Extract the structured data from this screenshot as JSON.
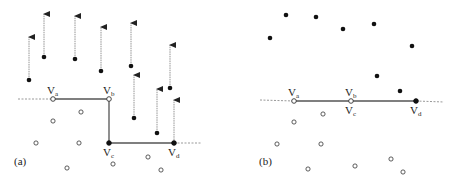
{
  "colors": {
    "point": "#111111",
    "solid_line": "#555555",
    "dashed_line": "#999999",
    "arrow": "#888888"
  },
  "panels": [
    {
      "id": "a",
      "label": "(a)",
      "label_pos": [
        14,
        165
      ],
      "dashed_left": [
        [
          18,
          99
        ],
        [
          53,
          99
        ]
      ],
      "dashed_right": [
        [
          174,
          143
        ],
        [
          202,
          143
        ]
      ],
      "path": [
        [
          53,
          99
        ],
        [
          109,
          99
        ],
        [
          109,
          143
        ],
        [
          174,
          143
        ]
      ],
      "vertices": [
        {
          "name": "Va",
          "main": "V",
          "sub": "a",
          "x": 53,
          "y": 99,
          "filled": false,
          "label_dx": -6,
          "label_dy": -5
        },
        {
          "name": "Vb",
          "main": "V",
          "sub": "b",
          "x": 109,
          "y": 99,
          "filled": false,
          "label_dx": -6,
          "label_dy": -5
        },
        {
          "name": "Vc",
          "main": "V",
          "sub": "c",
          "x": 109,
          "y": 143,
          "filled": true,
          "label_dx": -6,
          "label_dy": 13
        },
        {
          "name": "Vd",
          "main": "V",
          "sub": "d",
          "x": 174,
          "y": 143,
          "filled": true,
          "label_dx": -6,
          "label_dy": 13
        }
      ],
      "filled_points": [
        {
          "x": 29,
          "y": 80,
          "arrow_top": 37
        },
        {
          "x": 44,
          "y": 57,
          "arrow_top": 14
        },
        {
          "x": 75,
          "y": 59,
          "arrow_top": 16
        },
        {
          "x": 101,
          "y": 71,
          "arrow_top": 27
        },
        {
          "x": 131,
          "y": 66,
          "arrow_top": 23
        },
        {
          "x": 134,
          "y": 118,
          "arrow_top": 75
        },
        {
          "x": 157,
          "y": 133,
          "arrow_top": 89
        },
        {
          "x": 170,
          "y": 88,
          "arrow_top": 45
        },
        {
          "x": 174,
          "y": 143,
          "arrow_top": 100
        }
      ],
      "open_points": [
        {
          "x": 36,
          "y": 143
        },
        {
          "x": 53,
          "y": 121
        },
        {
          "x": 81,
          "y": 112
        },
        {
          "x": 79,
          "y": 143
        },
        {
          "x": 67,
          "y": 168
        },
        {
          "x": 113,
          "y": 164
        },
        {
          "x": 148,
          "y": 157
        },
        {
          "x": 161,
          "y": 170
        }
      ]
    },
    {
      "id": "b",
      "label": "(b)",
      "label_pos": [
        259,
        165
      ],
      "dashed_left": [
        [
          260,
          100
        ],
        [
          294,
          101
        ]
      ],
      "dashed_right": [
        [
          416,
          101
        ],
        [
          444,
          102
        ]
      ],
      "path": [
        [
          294,
          101
        ],
        [
          351,
          101
        ],
        [
          416,
          101
        ]
      ],
      "vertices": [
        {
          "name": "Va",
          "main": "V",
          "sub": "a",
          "x": 294,
          "y": 101,
          "filled": false,
          "label_dx": -6,
          "label_dy": -5
        },
        {
          "name": "Vb",
          "main": "V",
          "sub": "b",
          "x": 351,
          "y": 101,
          "filled": false,
          "label_dx": -6,
          "label_dy": -5
        },
        {
          "name": "Vc",
          "main": "V",
          "sub": "c",
          "x": 351,
          "y": 101,
          "filled": false,
          "label_dx": -6,
          "label_dy": 13
        },
        {
          "name": "Vd",
          "main": "V",
          "sub": "d",
          "x": 416,
          "y": 101,
          "filled": true,
          "label_dx": -6,
          "label_dy": 13
        }
      ],
      "filled_points": [
        {
          "x": 270,
          "y": 38
        },
        {
          "x": 286,
          "y": 15
        },
        {
          "x": 316,
          "y": 17
        },
        {
          "x": 343,
          "y": 29
        },
        {
          "x": 374,
          "y": 24
        },
        {
          "x": 412,
          "y": 46
        },
        {
          "x": 377,
          "y": 76
        },
        {
          "x": 400,
          "y": 91
        },
        {
          "x": 416,
          "y": 101
        }
      ],
      "open_points": [
        {
          "x": 323,
          "y": 114
        },
        {
          "x": 294,
          "y": 122
        },
        {
          "x": 277,
          "y": 144
        },
        {
          "x": 321,
          "y": 144
        },
        {
          "x": 308,
          "y": 169
        },
        {
          "x": 355,
          "y": 166
        },
        {
          "x": 391,
          "y": 159
        },
        {
          "x": 403,
          "y": 172
        }
      ]
    }
  ]
}
